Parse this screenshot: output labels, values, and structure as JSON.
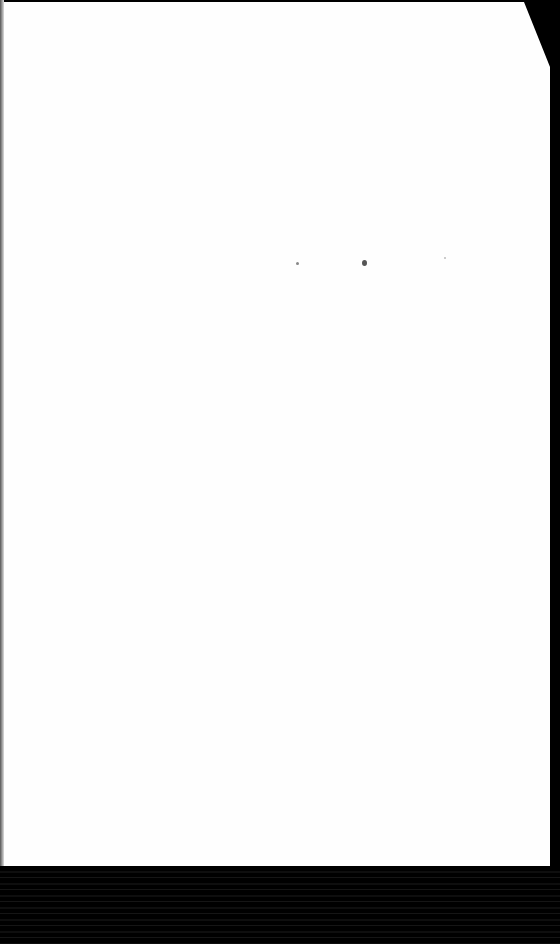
{
  "document": {
    "type": "scanned blank page",
    "text": "",
    "features": [
      "folded top-right corner",
      "faint specks",
      "dark scan border at bottom"
    ]
  }
}
